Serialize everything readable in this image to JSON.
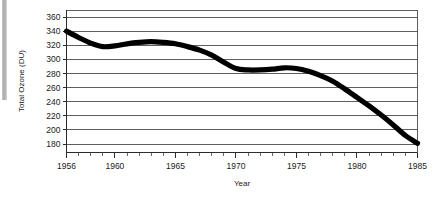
{
  "chart_data": {
    "type": "line",
    "title": "",
    "xlabel": "Year",
    "ylabel": "Total Ozone (DU)",
    "xlim": [
      1956,
      1985
    ],
    "ylim": [
      170,
      366
    ],
    "grid": "horizontal",
    "legend": "none",
    "ytick_labels": [
      "360",
      "340",
      "320",
      "300",
      "280",
      "260",
      "240",
      "220",
      "200",
      "180"
    ],
    "ytick_values": [
      360,
      340,
      320,
      300,
      280,
      260,
      240,
      220,
      200,
      180
    ],
    "xtick_labels": [
      "1956",
      "1960",
      "1965",
      "1970",
      "1975",
      "1980",
      "1985"
    ],
    "xtick_values": [
      1956,
      1960,
      1965,
      1970,
      1975,
      1980,
      1985
    ],
    "minor_xtick_step": 1,
    "series": [
      {
        "name": "Total Ozone",
        "color": "#000000",
        "x": [
          1956,
          1957,
          1958,
          1959,
          1960,
          1961,
          1962,
          1963,
          1964,
          1965,
          1966,
          1967,
          1968,
          1969,
          1970,
          1971,
          1972,
          1973,
          1974,
          1975,
          1976,
          1977,
          1978,
          1979,
          1980,
          1981,
          1982,
          1983,
          1984,
          1985
        ],
        "values": [
          340,
          331,
          323,
          318,
          319,
          322,
          324,
          325,
          324,
          322,
          318,
          313,
          306,
          296,
          287,
          285,
          285,
          286,
          288,
          287,
          283,
          277,
          269,
          258,
          246,
          234,
          221,
          207,
          192,
          181
        ]
      }
    ]
  },
  "axes": {
    "ylabel": "Total Ozone (DU)",
    "xlabel": "Year"
  }
}
